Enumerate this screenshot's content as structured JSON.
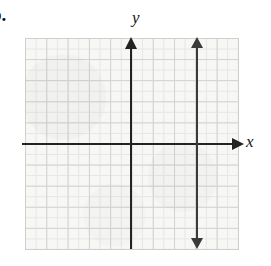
{
  "figure": {
    "problem_label": "b.",
    "axis_label_x": "x",
    "axis_label_y": "y",
    "colors": {
      "background": "#ffffff",
      "plate": "#f7f7f5",
      "grid_minor": "#e6e6e4",
      "grid_major": "#d2d2cf",
      "axis": "#232323",
      "graph_line": "#3a3a3a",
      "text": "#100f0f"
    }
  },
  "chart_data": {
    "type": "line",
    "title": "",
    "subtitle": "",
    "xlabel": "x",
    "ylabel": "y",
    "xlim": [
      -5,
      5
    ],
    "ylim": [
      -5,
      5
    ],
    "grid": true,
    "grid_major_step": 1,
    "grid_minor_step": 0.5,
    "grid_columns": 10,
    "grid_rows": 10,
    "tick_labels_x": [],
    "tick_labels_y": [],
    "axes": [
      {
        "name": "x-axis",
        "orientation": "horizontal",
        "position": 0,
        "arrowheads": [
          "right"
        ],
        "label": "x"
      },
      {
        "name": "y-axis",
        "orientation": "vertical",
        "position": 0,
        "arrowheads": [
          "up"
        ],
        "label": "y"
      }
    ],
    "legend": [],
    "legend_position": "none",
    "annotations": [],
    "series": [
      {
        "name": "x = 3",
        "type": "line",
        "equation": "x = 3",
        "orientation": "vertical",
        "x_intercept": 3,
        "slope": "undefined",
        "arrowheads": [
          "up",
          "down"
        ],
        "x": [
          3,
          3
        ],
        "y": [
          -5,
          5
        ]
      }
    ]
  }
}
